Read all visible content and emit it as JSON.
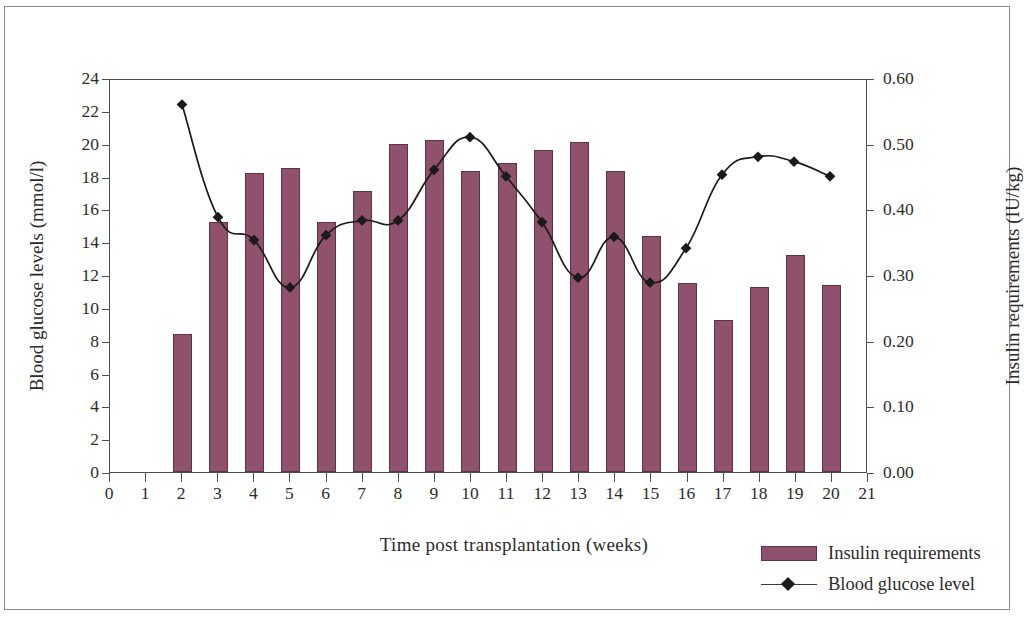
{
  "chart_data": {
    "type": "bar",
    "title": "",
    "xlabel": "Time post transplantation (weeks)",
    "ylabel": "Blood glucose levels (mmol/l)",
    "y2label": "Insulin requirements (IU/kg)",
    "x": [
      2,
      3,
      4,
      5,
      6,
      7,
      8,
      9,
      10,
      11,
      12,
      13,
      14,
      15,
      16,
      17,
      18,
      19,
      20
    ],
    "categories": [
      "2",
      "3",
      "4",
      "5",
      "6",
      "7",
      "8",
      "9",
      "10",
      "11",
      "12",
      "13",
      "14",
      "15",
      "16",
      "17",
      "18",
      "19",
      "20"
    ],
    "xlim": [
      0,
      21
    ],
    "xticks": [
      "0",
      "1",
      "2",
      "3",
      "4",
      "5",
      "6",
      "7",
      "8",
      "9",
      "10",
      "11",
      "12",
      "13",
      "14",
      "15",
      "16",
      "17",
      "18",
      "19",
      "20",
      "21"
    ],
    "ylim": [
      0,
      24
    ],
    "yticks": [
      "0",
      "2",
      "4",
      "6",
      "8",
      "10",
      "12",
      "14",
      "16",
      "18",
      "20",
      "22",
      "24"
    ],
    "y2lim": [
      0,
      0.6
    ],
    "y2ticks": [
      "0.00",
      "0.10",
      "0.20",
      "0.30",
      "0.40",
      "0.50",
      "0.60"
    ],
    "grid": false,
    "legend_position": "bottom-right",
    "series": [
      {
        "name": "Insulin requirements",
        "kind": "bar",
        "axis": "right",
        "unit": "IU/kg",
        "color": "#90516C",
        "values": [
          0.21,
          0.38,
          0.455,
          0.463,
          0.38,
          0.428,
          0.5,
          0.505,
          0.458,
          0.47,
          0.49,
          0.503,
          0.458,
          0.36,
          0.288,
          0.232,
          0.282,
          0.33,
          0.285
        ]
      },
      {
        "name": "Blood glucose level",
        "kind": "line",
        "axis": "left",
        "unit": "mmol/l",
        "color": "#1a1a1a",
        "marker": "diamond",
        "values": [
          22.5,
          15.6,
          14.2,
          11.3,
          14.5,
          15.4,
          15.4,
          18.5,
          20.5,
          18.1,
          15.3,
          11.9,
          14.4,
          11.6,
          13.7,
          18.2,
          19.3,
          19.0,
          18.1
        ]
      }
    ]
  },
  "axes": {
    "x_title": "Time post transplantation (weeks)",
    "y_left_title": "Blood glucose levels (mmol/l)",
    "y_right_title": "Insulin requirements (IU/kg)"
  },
  "legend": {
    "items": [
      {
        "label": "Insulin requirements",
        "marker": "bar-swatch",
        "color": "#90516C"
      },
      {
        "label": "Blood glucose level",
        "marker": "line-diamond",
        "color": "#1a1a1a"
      }
    ]
  }
}
